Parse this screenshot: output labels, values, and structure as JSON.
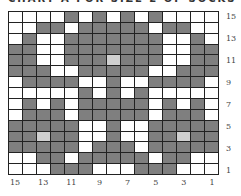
{
  "title": "CHART A FOR SIZE 2 OF SOCKS",
  "colors": {
    "white": "#ffffff",
    "gray": "#7f7f7f",
    "light": "#cfcfcf",
    "grid_line": "#222222"
  },
  "legend_key": {
    "W": "white (main color)",
    "G": "gray (contrast color)",
    "L": "light gray"
  },
  "grid": {
    "columns": 15,
    "rows": 15,
    "row_labels": [
      "15",
      "13",
      "11",
      "9",
      "7",
      "5",
      "3",
      "1"
    ],
    "column_labels": [
      "15",
      "13",
      "11",
      "9",
      "7",
      "5",
      "3",
      "1"
    ],
    "cells": [
      "WWWWGWGWGWGWWWW",
      "WWGGWGGGGGWGGWW",
      "WGWWGGGGGGGWWGW",
      "GGWWGGGGGGGWWGG",
      "GGWWGGGLGGGWWGG",
      "GGGWWGGGGGWWGGG",
      "WGGGGWWGWWGGGGW",
      "WWWWWGWGWGWWWWW",
      "WGWGWGGGGGWGWGW",
      "WGGGWGGGGGWGGGW",
      "GGGGGWWGWWGGGGG",
      "GGLGGWWGWWGGLGG",
      "GGGGGWGGGWGGGGG",
      "WWGGWGGGGGWGGWW",
      "WWWGGGWWWGGGWWW"
    ]
  },
  "chart_data": {
    "type": "heatmap",
    "title": "CHART A FOR SIZE 2 OF SOCKS",
    "x_tick_labels": [
      "15",
      "13",
      "11",
      "9",
      "7",
      "5",
      "3",
      "1"
    ],
    "y_tick_labels": [
      "15",
      "13",
      "11",
      "9",
      "7",
      "5",
      "3",
      "1"
    ],
    "rows_top_to_bottom": [
      "WWWWGWGWGWGWWWW",
      "WWGGWGGGGGWGGWW",
      "WGWWGGGGGGGWWGW",
      "GGWWGGGGGGGWWGG",
      "GGWWGGGLGGGWWGG",
      "GGGWWGGGGGWWGGG",
      "WGGGGWWGWWGGGGW",
      "WWWWWGWGWGWWWWW",
      "WGWGWGGGGGWGWGW",
      "WGGGWGGGGGWGGGW",
      "GGGGGWWGWWGGGGG",
      "GGLGGWWGWWGGLGG",
      "GGGGGWGGGWGGGGG",
      "WWGGWGGGGGWGGWW",
      "WWWGGGWWWGGGWWW"
    ]
  }
}
